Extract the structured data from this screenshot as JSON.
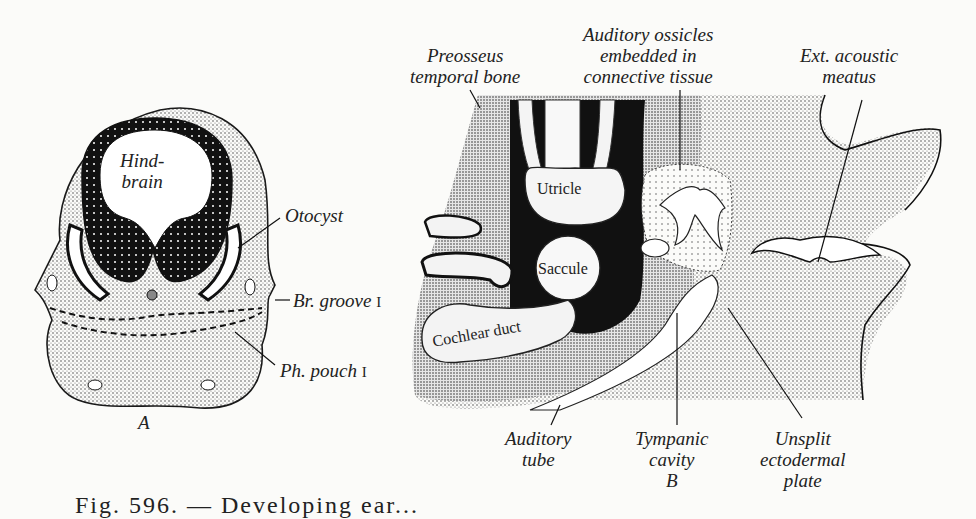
{
  "figure": {
    "caption_fragment": "Fig. 596. — Developing ear...",
    "panel_a": {
      "letter": "A",
      "labels": {
        "hindbrain": "Hind-brain",
        "hindbrain_line1": "Hind-",
        "hindbrain_line2": "brain",
        "otocyst": "Otocyst",
        "br_groove": "Br. groove",
        "br_groove_numeral": "I",
        "ph_pouch": "Ph. pouch",
        "ph_pouch_numeral": "I"
      }
    },
    "panel_b": {
      "letter": "B",
      "labels": {
        "preosseus_line1": "Preosseus",
        "preosseus_line2": "temporal bone",
        "ossicles_line1": "Auditory ossicles",
        "ossicles_line2": "embedded in",
        "ossicles_line3": "connective tissue",
        "ext_meatus_line1": "Ext. acoustic",
        "ext_meatus_line2": "meatus",
        "utricle": "Utricle",
        "saccule": "Saccule",
        "cochlear_duct": "Cochlear duct",
        "auditory_tube_line1": "Auditory",
        "auditory_tube_line2": "tube",
        "tympanic_line1": "Tympanic",
        "tympanic_line2": "cavity",
        "unsplit_line1": "Unsplit",
        "unsplit_line2": "ectodermal",
        "unsplit_line3": "plate"
      }
    },
    "colors": {
      "ink": "#1a1a1a",
      "paper": "#fbfbf9",
      "stipple": "#9a9a9a"
    }
  }
}
